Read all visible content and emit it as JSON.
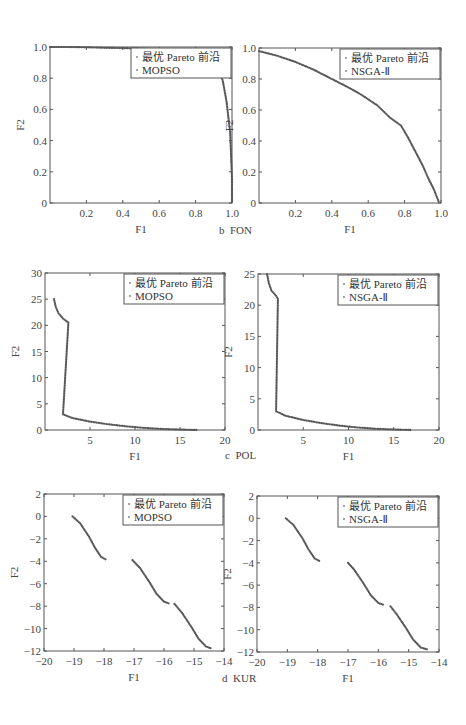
{
  "captions": {
    "fon": "b  FON",
    "pol": "c  POL",
    "kur": "d  KUR"
  },
  "chart_data": [
    {
      "id": "fon-mopso",
      "type": "scatter",
      "title": "",
      "xlabel": "F1",
      "ylabel": "F2",
      "xlim": [
        0,
        1
      ],
      "ylim": [
        0,
        1
      ],
      "xticks": [
        "0.2",
        "0.4",
        "0.6",
        "0.8",
        "1.0"
      ],
      "yticks": [
        "0",
        "0.2",
        "0.4",
        "0.6",
        "0.8",
        "1.0"
      ],
      "legend": [
        "最优 Pareto 前沿",
        "MOPSO"
      ],
      "legend_position": "upper right",
      "series": [
        {
          "name": "MOPSO",
          "points": [
            [
              0,
              1
            ],
            [
              0.1,
              1
            ],
            [
              0.2,
              0.998
            ],
            [
              0.3,
              0.995
            ],
            [
              0.4,
              0.993
            ],
            [
              0.5,
              0.99
            ],
            [
              0.6,
              0.985
            ],
            [
              0.7,
              0.975
            ],
            [
              0.8,
              0.96
            ],
            [
              0.85,
              0.95
            ],
            [
              0.9,
              0.93
            ],
            [
              0.93,
              0.85
            ],
            [
              0.95,
              0.78
            ],
            [
              0.97,
              0.65
            ],
            [
              0.98,
              0.55
            ],
            [
              0.99,
              0.45
            ],
            [
              0.995,
              0.3
            ],
            [
              1,
              0.15
            ],
            [
              1,
              0
            ]
          ]
        }
      ]
    },
    {
      "id": "fon-nsga",
      "type": "scatter",
      "xlabel": "F1",
      "ylabel": "F2",
      "xlim": [
        0,
        1
      ],
      "ylim": [
        0,
        1
      ],
      "xticks": [
        "0.2",
        "0.4",
        "0.6",
        "0.8",
        "1.0"
      ],
      "yticks": [
        "0",
        "0.2",
        "0.4",
        "0.6",
        "0.8",
        "1.0"
      ],
      "legend": [
        "最优 Pareto 前沿",
        "NSGA-Ⅱ"
      ],
      "legend_position": "upper right",
      "series": [
        {
          "name": "NSGA-Ⅱ",
          "points": [
            [
              0,
              0.98
            ],
            [
              0.1,
              0.95
            ],
            [
              0.2,
              0.91
            ],
            [
              0.3,
              0.86
            ],
            [
              0.4,
              0.8
            ],
            [
              0.5,
              0.74
            ],
            [
              0.56,
              0.7
            ],
            [
              0.65,
              0.63
            ],
            [
              0.72,
              0.55
            ],
            [
              0.78,
              0.5
            ],
            [
              0.82,
              0.42
            ],
            [
              0.86,
              0.33
            ],
            [
              0.9,
              0.24
            ],
            [
              0.93,
              0.16
            ],
            [
              0.96,
              0.09
            ],
            [
              0.98,
              0.03
            ],
            [
              0.99,
              0
            ]
          ]
        }
      ]
    },
    {
      "id": "pol-mopso",
      "type": "scatter",
      "xlabel": "F1",
      "ylabel": "F2",
      "xlim": [
        0,
        20
      ],
      "ylim": [
        0,
        30
      ],
      "xticks": [
        "5",
        "10",
        "15",
        "20"
      ],
      "yticks": [
        "0",
        "5",
        "10",
        "15",
        "20",
        "25",
        "30"
      ],
      "legend": [
        "最优 Pareto 前沿",
        "MOPSO"
      ],
      "legend_position": "upper right",
      "series": [
        {
          "name": "MOPSO",
          "points": [
            [
              1,
              25
            ],
            [
              1.2,
              23.5
            ],
            [
              1.5,
              22.3
            ],
            [
              2,
              21.3
            ],
            [
              2.6,
              20.5
            ],
            [
              2,
              3
            ],
            [
              3,
              2.3
            ],
            [
              5,
              1.6
            ],
            [
              7,
              1.1
            ],
            [
              9,
              0.7
            ],
            [
              11,
              0.4
            ],
            [
              13,
              0.2
            ],
            [
              15,
              0.08
            ],
            [
              17,
              0
            ]
          ]
        }
      ]
    },
    {
      "id": "pol-nsga",
      "type": "scatter",
      "xlabel": "F1",
      "ylabel": "F2",
      "xlim": [
        0,
        20
      ],
      "ylim": [
        0,
        25
      ],
      "xticks": [
        "5",
        "10",
        "15",
        "20"
      ],
      "yticks": [
        "0",
        "5",
        "10",
        "15",
        "20",
        "25"
      ],
      "legend": [
        "最优 Pareto 前沿",
        "NSGA-Ⅱ"
      ],
      "legend_position": "upper right",
      "series": [
        {
          "name": "NSGA-Ⅱ",
          "points": [
            [
              1,
              25
            ],
            [
              1.2,
              23.5
            ],
            [
              1.5,
              22.3
            ],
            [
              2,
              21.5
            ],
            [
              2.2,
              21
            ],
            [
              2,
              3
            ],
            [
              3,
              2.3
            ],
            [
              5,
              1.6
            ],
            [
              7,
              1.1
            ],
            [
              9,
              0.7
            ],
            [
              11,
              0.4
            ],
            [
              13,
              0.2
            ],
            [
              15,
              0.08
            ],
            [
              17,
              0
            ]
          ]
        }
      ]
    },
    {
      "id": "kur-mopso",
      "type": "scatter",
      "xlabel": "F1",
      "ylabel": "F2",
      "xlim": [
        -20,
        -14
      ],
      "ylim": [
        -12,
        2
      ],
      "xticks": [
        "-20",
        "-19",
        "-18",
        "-17",
        "-16",
        "-15",
        "-14"
      ],
      "yticks": [
        "-12",
        "-10",
        "-8",
        "-6",
        "-4",
        "-2",
        "0",
        "2"
      ],
      "legend": [
        "最优 Pareto 前沿",
        "MOPSO"
      ],
      "legend_position": "upper right",
      "series": [
        {
          "name": "MOPSO",
          "points": [
            [
              -19.05,
              0
            ],
            [
              -18.8,
              -0.6
            ],
            [
              -18.5,
              -1.8
            ],
            [
              -18.3,
              -2.8
            ],
            [
              -18.1,
              -3.6
            ],
            [
              -17.9,
              -3.9
            ],
            null,
            [
              -17.05,
              -3.9
            ],
            [
              -16.8,
              -4.6
            ],
            [
              -16.5,
              -5.8
            ],
            [
              -16.25,
              -6.9
            ],
            [
              -16,
              -7.6
            ],
            [
              -15.8,
              -7.8
            ],
            null,
            [
              -15.65,
              -7.8
            ],
            [
              -15.4,
              -8.6
            ],
            [
              -15.1,
              -9.8
            ],
            [
              -14.85,
              -10.9
            ],
            [
              -14.6,
              -11.6
            ],
            [
              -14.4,
              -11.8
            ]
          ]
        }
      ]
    },
    {
      "id": "kur-nsga",
      "type": "scatter",
      "xlabel": "F1",
      "ylabel": "F2",
      "xlim": [
        -20,
        -14
      ],
      "ylim": [
        -12,
        2
      ],
      "xticks": [
        "-20",
        "-19",
        "-18",
        "-17",
        "-16",
        "-15",
        "-14"
      ],
      "yticks": [
        "-12",
        "-10",
        "-8",
        "-6",
        "-4",
        "-2",
        "0",
        "2"
      ],
      "legend": [
        "最优 Pareto 前沿",
        "NSGA-Ⅱ"
      ],
      "legend_position": "upper right",
      "series": [
        {
          "name": "NSGA-Ⅱ",
          "points": [
            [
              -19.05,
              0
            ],
            [
              -18.8,
              -0.6
            ],
            [
              -18.5,
              -1.8
            ],
            [
              -18.3,
              -2.8
            ],
            [
              -18.1,
              -3.6
            ],
            [
              -17.9,
              -3.9
            ],
            null,
            [
              -17,
              -4
            ],
            [
              -16.8,
              -4.6
            ],
            [
              -16.5,
              -5.8
            ],
            [
              -16.25,
              -6.9
            ],
            [
              -16,
              -7.6
            ],
            [
              -15.8,
              -7.8
            ],
            null,
            [
              -15.6,
              -7.9
            ],
            [
              -15.4,
              -8.6
            ],
            [
              -15.1,
              -9.8
            ],
            [
              -14.85,
              -10.9
            ],
            [
              -14.6,
              -11.6
            ],
            [
              -14.35,
              -11.8
            ]
          ]
        }
      ]
    }
  ]
}
